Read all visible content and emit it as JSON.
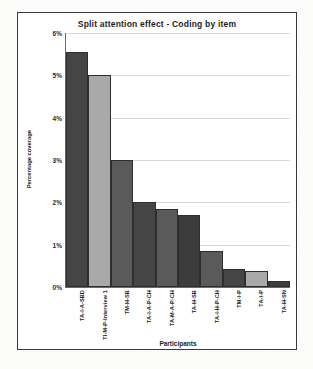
{
  "chart_data": {
    "type": "bar",
    "title": "Split attention effect - Coding by item",
    "xlabel": "Participants",
    "ylabel": "Percentage coverage",
    "ylim": [
      0,
      6
    ],
    "ytick_labels": [
      "6%",
      "5%",
      "4%",
      "3%",
      "2%",
      "1%",
      "0%"
    ],
    "ytick_values": [
      6,
      5,
      4,
      3,
      2,
      1,
      0
    ],
    "grid": true,
    "legend": "none",
    "categories": [
      "TA-I-A-SBD",
      "TI-M-P-Interview 1",
      "TM-H-SB",
      "TA-I-A-P-CH",
      "TA-M-A-P-CH",
      "TA-H-SB",
      "TA-I-H-P-CH",
      "TM-I-P",
      "TA-I-P",
      "TA-H-SN"
    ],
    "values": [
      5.55,
      5.0,
      3.0,
      2.0,
      1.85,
      1.7,
      0.85,
      0.42,
      0.38,
      0.15
    ],
    "bar_colors": [
      "#454545",
      "#a9a9a9",
      "#5a5a5a",
      "#454545",
      "#5a5a5a",
      "#3c3c3c",
      "#5a5a5a",
      "#454545",
      "#a9a9a9",
      "#3c3c3c"
    ]
  },
  "colors": {
    "frame": "#3a3a3a",
    "gridline": "#d8d8d8",
    "axis": "#6a6a6a",
    "text": "#1d1d1d",
    "dark_bar": "#454545",
    "light_bar": "#a9a9a9"
  }
}
